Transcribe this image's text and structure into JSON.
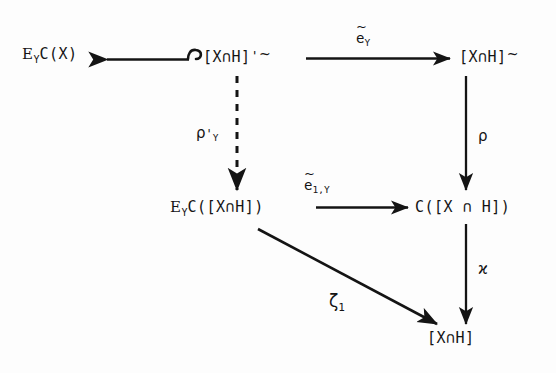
{
  "diagram": {
    "type": "commutative-diagram",
    "background_color": "#fdfdfd",
    "ink_color": "#141414",
    "width": 556,
    "height": 373,
    "nodes": [
      {
        "id": "top-left",
        "label": "E_Y C(X)",
        "base_e": "E",
        "sub_y": "Y",
        "rest": "C(X)",
        "x": 22,
        "y": 54
      },
      {
        "id": "top-middle",
        "label": "[X∩H]'~",
        "bracket": "[X∩H]",
        "prime": "'",
        "tilde": "~",
        "x": 205,
        "y": 54
      },
      {
        "id": "top-right",
        "label": "[X∩H]~",
        "bracket": "[X∩H]",
        "tilde": "~",
        "x": 460,
        "y": 54
      },
      {
        "id": "middle-left",
        "label": "E_Y C([X∩H])",
        "base_e": "E",
        "sub_y": "Y",
        "rest": "C([X∩H])",
        "x": 172,
        "y": 210
      },
      {
        "id": "middle-right",
        "label": "C([X ∩ H])",
        "x": 416,
        "y": 210
      },
      {
        "id": "bottom-right",
        "label": "[X∩H]",
        "x": 427,
        "y": 341
      }
    ],
    "arrows": [
      {
        "id": "hook-left",
        "style": "hooked-left",
        "from": "top-middle",
        "to": "top-left",
        "label": ""
      },
      {
        "id": "e-tilde-y",
        "style": "solid-right",
        "from": "top-middle",
        "to": "top-right",
        "label": "ẽ_Y",
        "label_base": "e",
        "label_tilde": "~",
        "label_sub": "Y"
      },
      {
        "id": "rho-prime-y",
        "style": "dashed-down",
        "from": "top-middle",
        "to": "middle-left",
        "label": "ρ'_Y",
        "label_base": "ρ",
        "label_prime": "'",
        "label_sub": "Y"
      },
      {
        "id": "e-tilde-1-y",
        "style": "solid-right",
        "from": "middle-left",
        "to": "middle-right",
        "label": "ẽ_1,Y",
        "label_base": "e",
        "label_tilde": "~",
        "label_sub": "1,Y"
      },
      {
        "id": "rho",
        "style": "solid-down",
        "from": "top-right",
        "to": "middle-right",
        "label": "ρ",
        "label_base": "ρ"
      },
      {
        "id": "varkappa",
        "style": "solid-down",
        "from": "middle-right",
        "to": "bottom-right",
        "label": "ϰ",
        "label_base": "ϰ"
      },
      {
        "id": "zeta-1",
        "style": "solid-diagonal",
        "from": "middle-left",
        "to": "bottom-right",
        "label": "ζ_1",
        "label_base": "ζ",
        "label_sub": "1"
      }
    ]
  }
}
